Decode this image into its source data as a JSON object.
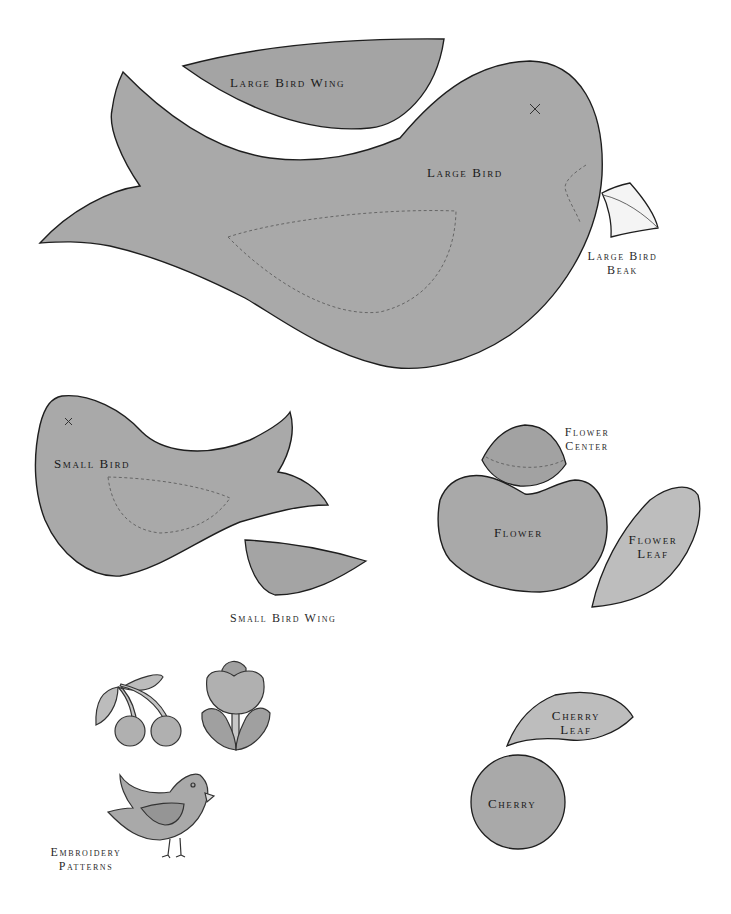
{
  "page": {
    "background": "#ffffff"
  },
  "colors": {
    "piece_fill": "#a9a9a9",
    "piece_fill_dark": "#a2a2a2",
    "leaf_fill": "#bdbdbd",
    "beak_fill": "#f4f4f4",
    "outline": "#1e1e1e",
    "stitch_line": "#666666"
  },
  "pieces": {
    "large_bird_wing": {
      "label": "Large Bird Wing"
    },
    "large_bird": {
      "label": "Large Bird",
      "eye_mark": "×"
    },
    "large_bird_beak": {
      "label_line1": "Large Bird",
      "label_line2": "Beak"
    },
    "small_bird": {
      "label": "Small Bird",
      "eye_mark": "×"
    },
    "small_bird_wing": {
      "label": "Small Bird Wing"
    },
    "flower_center": {
      "label_line1": "Flower",
      "label_line2": "Center"
    },
    "flower": {
      "label": "Flower"
    },
    "flower_leaf": {
      "label_line1": "Flower",
      "label_line2": "Leaf"
    },
    "cherry_leaf": {
      "label_line1": "Cherry",
      "label_line2": "Leaf"
    },
    "cherry": {
      "label": "Cherry"
    }
  },
  "embroidery": {
    "label_line1": "Embroidery",
    "label_line2": "Patterns",
    "motifs": [
      "cherries",
      "tulip",
      "bird"
    ]
  }
}
